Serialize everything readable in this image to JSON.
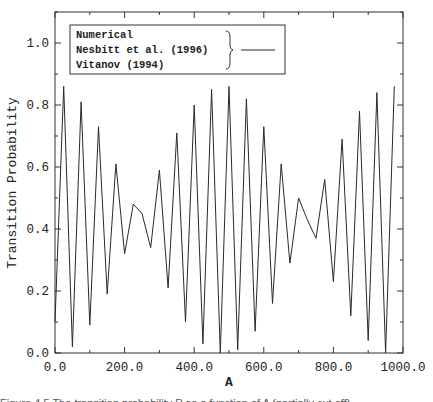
{
  "chart_data": {
    "type": "line",
    "title": "",
    "xlabel": "A",
    "ylabel": "Transition Probability",
    "xlim": [
      0,
      1000
    ],
    "ylim": [
      0,
      1.1
    ],
    "x_ticks": [
      "0.0",
      "200.0",
      "400.0",
      "600.0",
      "800.0",
      "1000.0"
    ],
    "y_ticks": [
      "0.0",
      "0.2",
      "0.4",
      "0.6",
      "0.8",
      "1.0"
    ],
    "grid": false,
    "legend_position": "upper-left",
    "legend": {
      "entries": [
        "Numerical",
        "Nesbitt et al. (1996)",
        "Vitanov (1994)"
      ],
      "note": "all three entries share one solid line (grouped by brace)"
    },
    "series": [
      {
        "name": "Numerical / Nesbitt et al. (1996) / Vitanov (1994)",
        "x": [
          0,
          25,
          50,
          75,
          100,
          125,
          150,
          175,
          200,
          225,
          250,
          275,
          300,
          325,
          350,
          375,
          400,
          425,
          450,
          475,
          500,
          525,
          550,
          575,
          600,
          625,
          650,
          675,
          700,
          725,
          750,
          775,
          800,
          825,
          850,
          875,
          900,
          925,
          950,
          975
        ],
        "values": [
          0.1,
          0.86,
          0.02,
          0.81,
          0.09,
          0.73,
          0.19,
          0.61,
          0.32,
          0.48,
          0.45,
          0.34,
          0.59,
          0.21,
          0.71,
          0.1,
          0.8,
          0.03,
          0.85,
          0.0,
          0.86,
          0.01,
          0.82,
          0.07,
          0.73,
          0.16,
          0.61,
          0.29,
          0.5,
          0.43,
          0.37,
          0.56,
          0.23,
          0.69,
          0.12,
          0.78,
          0.04,
          0.84,
          0.0,
          0.86
        ]
      }
    ]
  },
  "caption": {
    "text": "Figure 4.5   The transition probability P as a function of A (partially cut off)"
  },
  "colors": {
    "line": "#2a2a2a",
    "axis": "#333333",
    "background": "#ffffff"
  }
}
